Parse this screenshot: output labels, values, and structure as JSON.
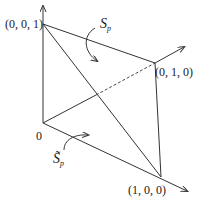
{
  "diagram": {
    "vertices": {
      "origin": {
        "label": "0"
      },
      "z_unit": {
        "label": "(0, 0, 1)"
      },
      "y_unit": {
        "label": "(0, 1, 0)"
      },
      "x_unit": {
        "label": "(1, 0, 0)"
      }
    },
    "regions": {
      "s_p": {
        "symbol": "S",
        "subscript": "p"
      },
      "s_p_tilde": {
        "symbol": "S̃",
        "subscript": "p"
      }
    },
    "colors": {
      "line": "#333333",
      "text": "#1a1a1a",
      "background": "#ffffff"
    }
  }
}
